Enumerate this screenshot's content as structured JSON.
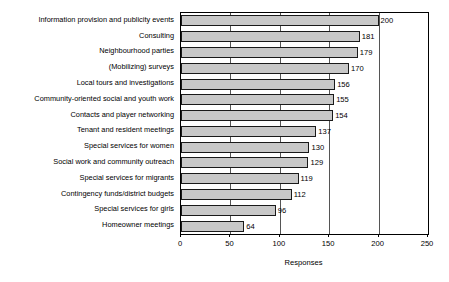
{
  "chart_data": {
    "type": "bar",
    "orientation": "horizontal",
    "title": "",
    "xlabel": "Responses",
    "ylabel": "",
    "xlim": [
      0,
      250
    ],
    "xticks": [
      0,
      50,
      100,
      150,
      200,
      250
    ],
    "grid": true,
    "legend": false,
    "bar_color": "#c8c8c8",
    "bar_edge_color": "#1a1a1a",
    "show_value_labels": true,
    "categories": [
      "Information provision and publicity events",
      "Consulting",
      "Neighbourhood parties",
      "(Mobilizing) surveys",
      "Local tours and investigations",
      "Community-oriented social and youth work",
      "Contacts and player networking",
      "Tenant and resident meetings",
      "Special services for women",
      "Social work and community outreach",
      "Special services for migrants",
      "Contingency funds/district budgets",
      "Special services for girls",
      "Homeowner meetings"
    ],
    "values": [
      200,
      181,
      179,
      170,
      156,
      155,
      154,
      137,
      130,
      129,
      119,
      112,
      96,
      64
    ]
  }
}
